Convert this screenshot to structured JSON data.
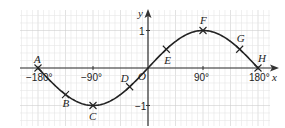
{
  "chart_data": {
    "type": "line",
    "title": "",
    "function": "y = sin x",
    "xlabel": "x",
    "ylabel": "y",
    "xlim": [
      -180,
      180
    ],
    "ylim": [
      -1,
      1
    ],
    "x_ticks": [
      {
        "value": -180,
        "label": "−180°"
      },
      {
        "value": -90,
        "label": "−90°"
      },
      {
        "value": 90,
        "label": "90°"
      },
      {
        "value": 180,
        "label": "180°"
      }
    ],
    "y_ticks": [
      {
        "value": 1,
        "label": "1"
      },
      {
        "value": -1,
        "label": "−1"
      }
    ],
    "origin_label": "O",
    "grid": true,
    "curve_x": [
      -180,
      -150,
      -135,
      -120,
      -90,
      -60,
      -30,
      0,
      30,
      60,
      90,
      120,
      150,
      180
    ],
    "curve_y": [
      0,
      -0.5,
      -0.71,
      -0.87,
      -1,
      -0.87,
      -0.5,
      0,
      0.5,
      0.87,
      1,
      0.87,
      0.5,
      0
    ],
    "points": [
      {
        "label": "A",
        "x": -180,
        "y": 0
      },
      {
        "label": "B",
        "x": -135,
        "y": -0.71
      },
      {
        "label": "C",
        "x": -90,
        "y": -1
      },
      {
        "label": "D",
        "x": -30,
        "y": -0.5
      },
      {
        "label": "E",
        "x": 30,
        "y": 0.5
      },
      {
        "label": "F",
        "x": 90,
        "y": 1
      },
      {
        "label": "G",
        "x": 150,
        "y": 0.5
      },
      {
        "label": "H",
        "x": 180,
        "y": 0
      }
    ],
    "colors": {
      "grid_minor": "#e6e6e6",
      "grid_major": "#cfcfcf",
      "axis": "#333333",
      "curve": "#222222"
    }
  }
}
